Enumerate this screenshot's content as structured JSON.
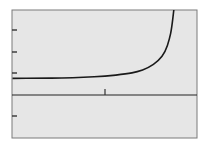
{
  "chart_data": {
    "type": "line",
    "title": "",
    "xlabel": "",
    "ylabel": "",
    "grid": false,
    "legend": null,
    "xlim": [
      -4.3,
      4.3
    ],
    "ylim": [
      -2,
      4
    ],
    "x_ticks": [
      0
    ],
    "y_ticks": [
      -1,
      1,
      2,
      3
    ],
    "vertical_asymptote_x": 3.3,
    "series": [
      {
        "name": "f(x)",
        "x": [
          -4.3,
          -3,
          -2,
          -1,
          0,
          1,
          1.5,
          2,
          2.5,
          2.8,
          3.0,
          3.1,
          3.2
        ],
        "y": [
          0.77,
          0.78,
          0.79,
          0.82,
          0.87,
          0.98,
          1.08,
          1.25,
          1.6,
          2.0,
          2.6,
          3.1,
          4.0
        ]
      }
    ]
  },
  "colors": {
    "background": "#ffffff",
    "plot_area": "#e6e6e6",
    "frame": "#7a7a7a",
    "axis": "#222222",
    "curve": "#1a1a1a"
  }
}
